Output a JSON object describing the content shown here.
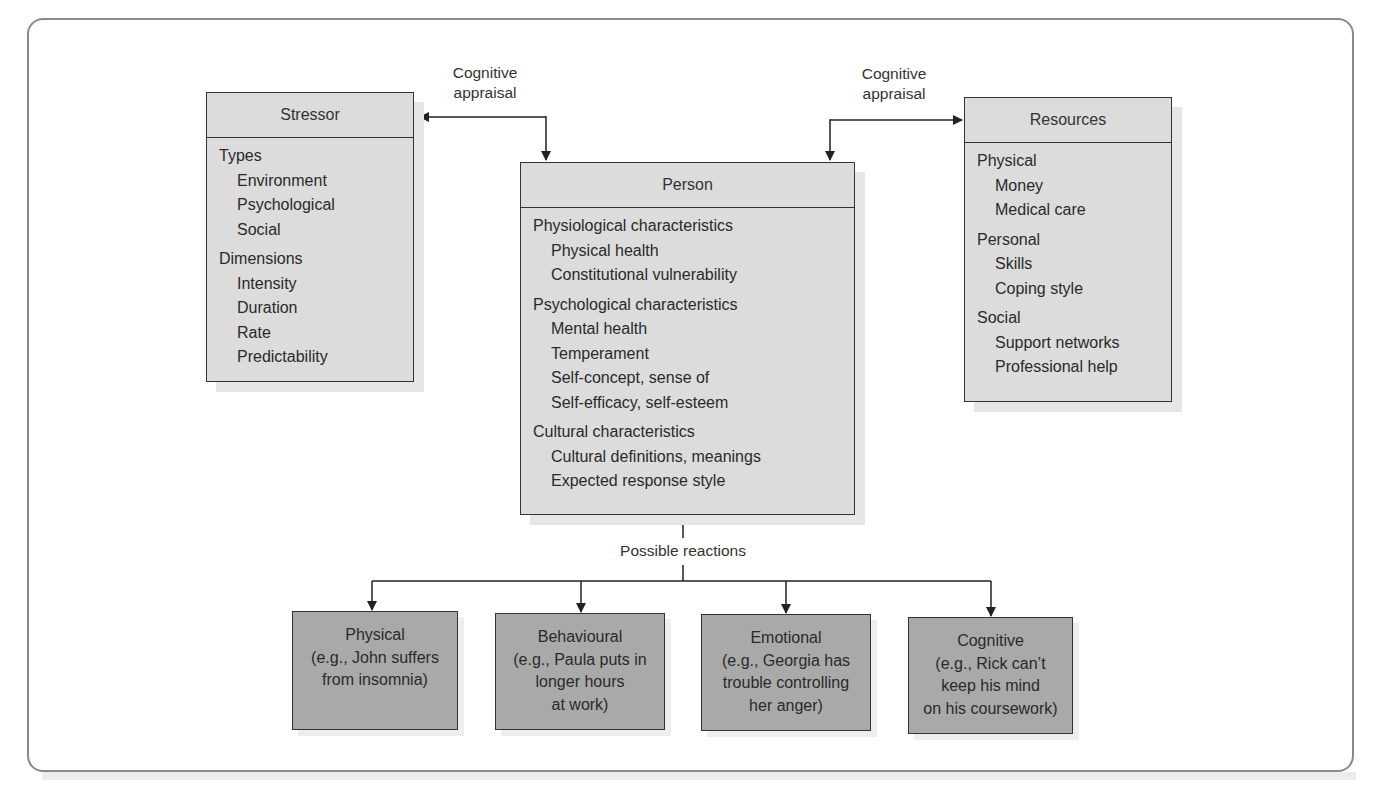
{
  "stressor": {
    "title": "Stressor",
    "groups": [
      {
        "title": "Types",
        "items": [
          "Environment",
          "Psychological",
          "Social"
        ]
      },
      {
        "title": "Dimensions",
        "items": [
          "Intensity",
          "Duration",
          "Rate",
          "Predictability"
        ]
      }
    ]
  },
  "person": {
    "title": "Person",
    "groups": [
      {
        "title": "Physiological characteristics",
        "items": [
          "Physical health",
          "Constitutional vulnerability"
        ]
      },
      {
        "title": "Psychological characteristics",
        "items": [
          "Mental health",
          "Temperament",
          "Self-concept, sense of",
          "Self-efficacy, self-esteem"
        ]
      },
      {
        "title": "Cultural characteristics",
        "items": [
          "Cultural definitions, meanings",
          "Expected response style"
        ]
      }
    ]
  },
  "resources": {
    "title": "Resources",
    "groups": [
      {
        "title": "Physical",
        "items": [
          "Money",
          "Medical care"
        ]
      },
      {
        "title": "Personal",
        "items": [
          "Skills",
          "Coping style"
        ]
      },
      {
        "title": "Social",
        "items": [
          "Support networks",
          "Professional help"
        ]
      }
    ]
  },
  "connectors": {
    "left_label_line1": "Cognitive",
    "left_label_line2": "appraisal",
    "right_label_line1": "Cognitive",
    "right_label_line2": "appraisal",
    "reactions_label": "Possible reactions"
  },
  "reactions": [
    {
      "title": "Physical",
      "lines": [
        "(e.g., John suffers",
        "from insomnia)"
      ]
    },
    {
      "title": "Behavioural",
      "lines": [
        "(e.g., Paula puts in",
        "longer hours",
        "at work)"
      ]
    },
    {
      "title": "Emotional",
      "lines": [
        "(e.g., Georgia has",
        "trouble controlling",
        "her anger)"
      ]
    },
    {
      "title": "Cognitive",
      "lines": [
        "(e.g., Rick can’t",
        "keep his mind",
        "on his coursework)"
      ]
    }
  ],
  "colors": {
    "box_fill": "#dcdcdc",
    "reaction_fill": "#a9a9a9",
    "line": "#333333",
    "frame": "#8a8a8a"
  }
}
